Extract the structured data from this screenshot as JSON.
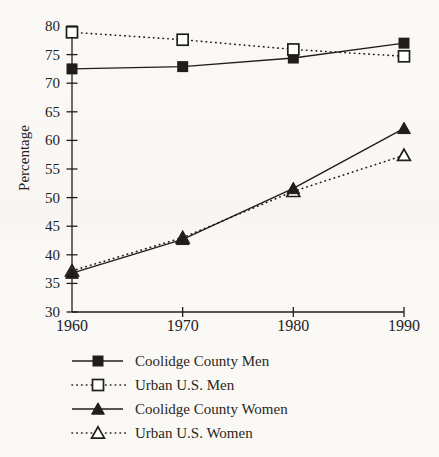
{
  "figure": {
    "background": "#f9f8f5",
    "ink_color": "#201e1b"
  },
  "chart_data": {
    "type": "line",
    "title": "",
    "xlabel": "",
    "ylabel": "Percentage",
    "x_tick_labels": [
      "1960",
      "1970",
      "1980",
      "1990"
    ],
    "ylim": [
      30,
      80
    ],
    "ytick_step": 5,
    "grid": false,
    "legend_position": "below-left",
    "series": [
      {
        "name": "Coolidge County Men",
        "marker": "filled-square",
        "linestyle": "solid",
        "values": [
          72.5,
          72.9,
          74.4,
          77.0
        ]
      },
      {
        "name": "Urban U.S. Men",
        "marker": "open-square",
        "linestyle": "dotted",
        "values": [
          78.9,
          77.6,
          75.9,
          74.7
        ]
      },
      {
        "name": "Coolidge County Women",
        "marker": "filled-triangle",
        "linestyle": "solid",
        "values": [
          36.8,
          42.7,
          51.6,
          62.1
        ]
      },
      {
        "name": "Urban U.S. Women",
        "marker": "open-triangle",
        "linestyle": "dotted",
        "values": [
          37.2,
          43.0,
          51.1,
          57.4
        ]
      }
    ],
    "draw_order": [
      0,
      1,
      3,
      2
    ]
  }
}
